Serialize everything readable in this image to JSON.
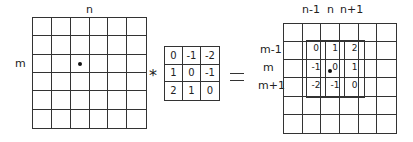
{
  "input_grid": {
    "rows": 6,
    "cols": 6,
    "col_label": "n",
    "row_label": "m",
    "marked_cell": {
      "row": 2,
      "col": 2
    }
  },
  "operator": "*",
  "kernel": {
    "values": [
      [
        0,
        -1,
        -2
      ],
      [
        1,
        0,
        -1
      ],
      [
        2,
        1,
        0
      ]
    ]
  },
  "equals": "=",
  "output_grid": {
    "rows": 6,
    "cols": 6,
    "col_labels": [
      "n-1",
      "n",
      "n+1"
    ],
    "row_labels": [
      "m-1",
      "m",
      "m+1"
    ],
    "overlay_values": [
      [
        0,
        1,
        2
      ],
      [
        -1,
        0,
        1
      ],
      [
        -2,
        -1,
        0
      ]
    ],
    "marked_cell": {
      "row": 2,
      "col": 2
    }
  }
}
